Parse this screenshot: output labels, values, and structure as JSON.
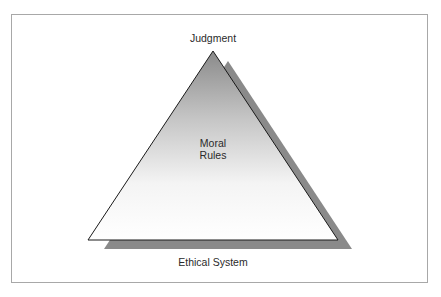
{
  "diagram": {
    "type": "triangle",
    "labels": {
      "apex": "Judgment",
      "center_line1": "Moral",
      "center_line2": "Rules",
      "base": "Ethical System"
    },
    "colors": {
      "frame_border": "#a8a8a8",
      "triangle_stroke": "#1a1a1a",
      "gradient_top": "#8c8c8c",
      "gradient_bottom": "#ffffff",
      "shadow": "#8a8a8a"
    }
  }
}
